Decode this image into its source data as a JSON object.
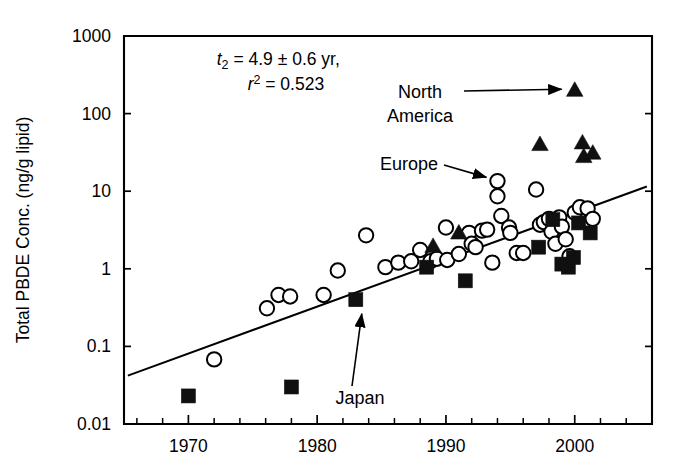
{
  "chart_data": {
    "type": "scatter",
    "title": "",
    "xlabel": "",
    "ylabel": "Total PBDE Conc. (ng/g lipid)",
    "yscale": "log",
    "xlim": [
      1965,
      2006
    ],
    "ylim": [
      0.01,
      1000
    ],
    "grid": false,
    "legend_position": "none",
    "xticks": [
      1970,
      1980,
      1990,
      2000
    ],
    "xtick_labels": [
      "1970",
      "1980",
      "1990",
      "2000"
    ],
    "xminor_ticks": [
      1966,
      1968,
      1972,
      1974,
      1976,
      1978,
      1982,
      1984,
      1986,
      1988,
      1992,
      1994,
      1996,
      1998,
      2002,
      2004
    ],
    "yticks": [
      0.01,
      0.1,
      1,
      10,
      100,
      1000
    ],
    "ytick_labels": [
      "0.01",
      "0.1",
      "1",
      "10",
      "100",
      "1000"
    ],
    "annotations": [
      {
        "name": "doubling-time",
        "text": "t2 = 4.9 ± 0.6 yr,",
        "x": 1972.2,
        "y": 420
      },
      {
        "name": "r-squared",
        "text": "r2 = 0.523",
        "x": 1974.6,
        "y": 200
      },
      {
        "name": "north-america-label",
        "text": "North America",
        "points_to": [
          2000,
          200
        ]
      },
      {
        "name": "europe-label",
        "text": "Europe",
        "points_to": [
          1994,
          13
        ]
      },
      {
        "name": "japan-label",
        "text": "Japan",
        "points_to": [
          1983,
          0.4
        ]
      }
    ],
    "trend": {
      "name": "regression-line",
      "x_start": 1965.3,
      "y_start": 0.042,
      "x_end": 2005.6,
      "y_end": 11.5
    },
    "series": [
      {
        "name": "Europe",
        "marker": "open-circle",
        "points": [
          [
            1972.0,
            0.068
          ],
          [
            1976.1,
            0.31
          ],
          [
            1977.0,
            0.46
          ],
          [
            1977.9,
            0.44
          ],
          [
            1980.5,
            0.46
          ],
          [
            1981.6,
            0.95
          ],
          [
            1983.8,
            2.7
          ],
          [
            1985.3,
            1.05
          ],
          [
            1986.3,
            1.2
          ],
          [
            1987.3,
            1.25
          ],
          [
            1988.0,
            1.75
          ],
          [
            1988.8,
            1.25
          ],
          [
            1989.3,
            1.35
          ],
          [
            1990.0,
            3.4
          ],
          [
            1990.1,
            1.3
          ],
          [
            1991.0,
            1.55
          ],
          [
            1991.8,
            2.9
          ],
          [
            1992.0,
            2.1
          ],
          [
            1992.3,
            1.9
          ],
          [
            1992.8,
            3.1
          ],
          [
            1993.2,
            3.2
          ],
          [
            1993.6,
            1.2
          ],
          [
            1994.0,
            13.5
          ],
          [
            1994.0,
            8.6
          ],
          [
            1994.3,
            4.8
          ],
          [
            1994.9,
            3.4
          ],
          [
            1995.0,
            2.9
          ],
          [
            1995.5,
            1.6
          ],
          [
            1996.0,
            1.6
          ],
          [
            1997.0,
            10.5
          ],
          [
            1997.3,
            3.7
          ],
          [
            1997.6,
            4.0
          ],
          [
            1998.0,
            4.4
          ],
          [
            1998.2,
            3.0
          ],
          [
            1998.5,
            2.1
          ],
          [
            1998.8,
            4.6
          ],
          [
            1999.0,
            3.5
          ],
          [
            1999.3,
            2.4
          ],
          [
            1999.6,
            1.45
          ],
          [
            2000.0,
            5.3
          ],
          [
            2000.4,
            6.2
          ],
          [
            2001.0,
            6.0
          ],
          [
            2001.4,
            4.4
          ]
        ]
      },
      {
        "name": "Japan",
        "marker": "filled-square",
        "points": [
          [
            1970.0,
            0.023
          ],
          [
            1978.0,
            0.03
          ],
          [
            1983.0,
            0.4
          ],
          [
            1988.5,
            1.05
          ],
          [
            1991.5,
            0.7
          ],
          [
            1997.2,
            1.9
          ],
          [
            1998.3,
            4.3
          ],
          [
            1999.0,
            1.15
          ],
          [
            1999.5,
            1.05
          ],
          [
            1999.9,
            1.4
          ],
          [
            2000.3,
            3.9
          ],
          [
            2001.2,
            2.9
          ]
        ]
      },
      {
        "name": "North America",
        "marker": "filled-triangle",
        "points": [
          [
            1989.0,
            1.95
          ],
          [
            1991.0,
            2.9
          ],
          [
            1997.3,
            40.0
          ],
          [
            2000.0,
            200.0
          ],
          [
            2000.6,
            42.0
          ],
          [
            2000.7,
            28.0
          ],
          [
            2001.4,
            31.0
          ]
        ]
      }
    ]
  }
}
